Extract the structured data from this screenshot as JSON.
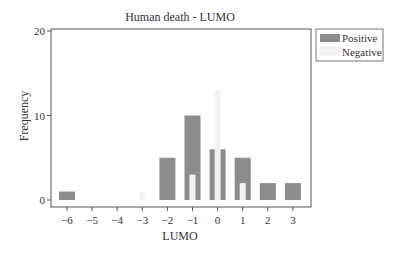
{
  "chart_data": {
    "type": "bar",
    "title": "Human death - LUMO",
    "xlabel": "LUMO",
    "ylabel": "Frequency",
    "categories": [
      "-6",
      "-5",
      "-4",
      "-3",
      "-2",
      "-1",
      "0",
      "1",
      "2",
      "3"
    ],
    "x_ticks": [
      "−6",
      "−5",
      "−4",
      "−3",
      "−2",
      "−1",
      "0",
      "1",
      "2",
      "3"
    ],
    "y_ticks": [
      "0",
      "10",
      "20"
    ],
    "ylim": [
      -1,
      21
    ],
    "grid": false,
    "legend_position": "top-right outside",
    "series": [
      {
        "name": "Positive",
        "color": "#8c8c8c",
        "values": [
          1,
          0,
          0,
          0,
          5,
          10,
          6,
          5,
          2,
          2
        ]
      },
      {
        "name": "Negative",
        "color": "#f2f2f2",
        "values": [
          0,
          0,
          0,
          1,
          0,
          3,
          13,
          2,
          0,
          0
        ]
      }
    ]
  },
  "legend": {
    "items": [
      {
        "label": "Positive",
        "color": "#8c8c8c"
      },
      {
        "label": "Negative",
        "color": "#f2f2f2"
      }
    ]
  }
}
